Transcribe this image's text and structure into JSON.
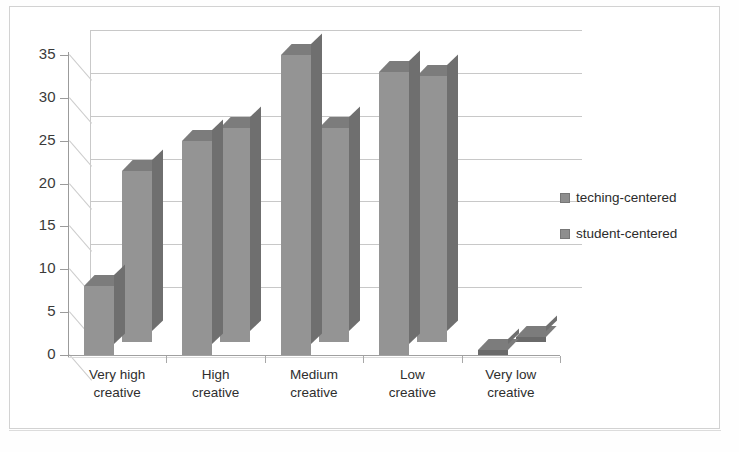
{
  "chart_data": {
    "type": "bar",
    "title": "",
    "subtitle": "",
    "xlabel": "",
    "ylabel": "",
    "categories": [
      "Very high creative",
      "High creative",
      "Medium creative",
      "Low creative",
      "Very low creative"
    ],
    "category_lines": [
      [
        "Very high",
        "creative"
      ],
      [
        "High",
        "creative"
      ],
      [
        "Medium",
        "creative"
      ],
      [
        "Low",
        "creative"
      ],
      [
        "Very low",
        "creative"
      ]
    ],
    "series": [
      {
        "name": "teching-centered",
        "values": [
          8,
          25,
          35,
          33,
          0
        ]
      },
      {
        "name": "student-centered",
        "values": [
          20,
          25,
          25,
          31,
          0
        ]
      }
    ],
    "ylim": [
      0,
      35
    ],
    "yticks": [
      0,
      5,
      10,
      15,
      20,
      25,
      30,
      35
    ],
    "ytick_labels": [
      "0",
      "5",
      "10",
      "15",
      "20",
      "25",
      "30",
      "35"
    ],
    "grid": true,
    "grid_axis": "y",
    "legend_position": "right",
    "style": "3d-clustered-column",
    "colors": {
      "series_front": "#949494",
      "series_top": "#7c7c7c",
      "series_side": "#6f6f6f",
      "gridline": "#c8c8c8",
      "axis": "#9b9b9b",
      "text": "#2e2e2e",
      "frame": "#d2d2d2",
      "background": "#ffffff"
    }
  },
  "legend": {
    "items": [
      {
        "label": "teching-centered"
      },
      {
        "label": "student-centered"
      }
    ]
  }
}
